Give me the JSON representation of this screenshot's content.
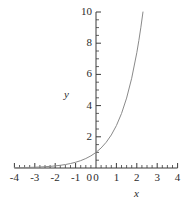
{
  "chart_data": {
    "type": "line",
    "title": "",
    "subtitle": "",
    "xlabel": "x",
    "ylabel": "y",
    "xlim": [
      -4,
      4
    ],
    "ylim": [
      0,
      10
    ],
    "grid": false,
    "legend": null,
    "x_ticks": [
      "-4",
      "-3",
      "-2",
      "-1",
      "0",
      "1",
      "2",
      "3",
      "4"
    ],
    "x_tick_values": [
      -4,
      -3,
      -2,
      -1,
      0,
      1,
      2,
      3,
      4
    ],
    "y_ticks": [
      "0",
      "2",
      "4",
      "6",
      "8",
      "10"
    ],
    "y_tick_values": [
      0,
      2,
      4,
      6,
      8,
      10
    ],
    "x_minor_tick_step": 0.25,
    "y_minor_tick_step": 0.5,
    "series": [
      {
        "name": "y = e^x",
        "color": "#8a8a8a",
        "x": [
          -4,
          -3.75,
          -3.5,
          -3.25,
          -3,
          -2.75,
          -2.5,
          -2.25,
          -2,
          -1.75,
          -1.5,
          -1.25,
          -1,
          -0.75,
          -0.5,
          -0.25,
          0,
          0.25,
          0.5,
          0.75,
          1,
          1.25,
          1.5,
          1.75,
          2,
          2.1,
          2.2,
          2.3026
        ],
        "values": [
          0.018,
          0.024,
          0.03,
          0.039,
          0.05,
          0.064,
          0.082,
          0.105,
          0.135,
          0.174,
          0.223,
          0.287,
          0.368,
          0.472,
          0.607,
          0.779,
          1,
          1.284,
          1.649,
          2.117,
          2.718,
          3.49,
          4.482,
          5.755,
          7.389,
          8.166,
          9.025,
          10
        ]
      }
    ]
  },
  "axes": {
    "y_axis_label": "y",
    "x_axis_label": "x"
  },
  "colors": {
    "curve": "#8a8a8a",
    "axis": "#3a3a3a",
    "text": "#2b2b2b",
    "background": "#ffffff"
  }
}
